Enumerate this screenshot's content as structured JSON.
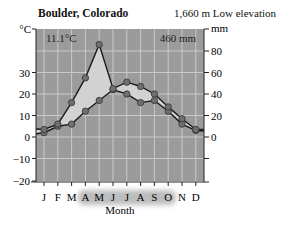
{
  "header": {
    "title": "Boulder, Colorado",
    "elevation": "1,660 m Low elevation"
  },
  "annotations": {
    "mean_temp": "11.1°C",
    "annual_precip": "460 mm"
  },
  "axes": {
    "left_unit": "°C",
    "right_unit": "mm",
    "xlabel": "Month",
    "left_ticks": [
      "30",
      "20",
      "10",
      "0",
      "−10",
      "−20"
    ],
    "right_ticks": [
      "80",
      "60",
      "40",
      "20",
      "0"
    ],
    "months": [
      "J",
      "F",
      "M",
      "A",
      "M",
      "J",
      "J",
      "A",
      "S",
      "O",
      "N",
      "D"
    ]
  },
  "colors": {
    "plot_bg": "#9b9b9b",
    "grid": "#c9c9c9",
    "fill_between": "#d2d2d2",
    "line": "#1a1a1a",
    "marker": "#6f6f6f",
    "month_highlight": "#bdbdbd"
  },
  "chart_data": {
    "type": "line",
    "title": "Boulder, Colorado",
    "subtitle": "1,660 m Low elevation",
    "xlabel": "Month",
    "ylabel_left": "°C",
    "ylabel_right": "mm",
    "categories": [
      "J",
      "F",
      "M",
      "A",
      "M",
      "J",
      "J",
      "A",
      "S",
      "O",
      "N",
      "D"
    ],
    "series": [
      {
        "name": "Temperature (°C)",
        "axis": "left",
        "values": [
          2,
          5,
          6,
          12,
          17,
          22,
          20,
          16,
          17,
          12,
          6,
          3
        ]
      },
      {
        "name": "Precipitation (mm)",
        "axis": "right",
        "values": [
          7,
          12,
          32,
          55,
          86,
          45,
          51,
          47,
          40,
          28,
          17,
          7
        ]
      }
    ],
    "ylim_left": [
      -20,
      40
    ],
    "ylim_right": [
      0,
      80
    ],
    "annotations": [
      "11.1°C",
      "460 mm"
    ],
    "highlighted_months": [
      "A",
      "M",
      "J",
      "J",
      "A",
      "S",
      "O"
    ],
    "grid": true,
    "legend": "none"
  }
}
